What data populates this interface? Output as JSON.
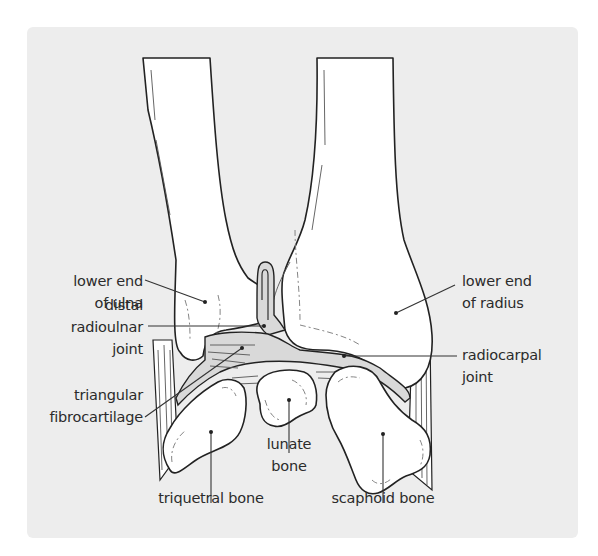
{
  "diagram": {
    "background_color": "#ededed",
    "line_color": "#222222",
    "bone_fill": "#ffffff",
    "cartilage_fill": "#d9d9d9",
    "labels": {
      "ulna_end": {
        "line1": "lower end",
        "line2": "of ulna"
      },
      "radius_end": {
        "line1": "lower end",
        "line2": "of radius"
      },
      "distal_radioulnar": {
        "line1": "distal",
        "line2": "radioulnar",
        "line3": "joint"
      },
      "radiocarpal": {
        "line1": "radiocarpal",
        "line2": "joint"
      },
      "fibrocartilage": {
        "line1": "triangular",
        "line2": "fibrocartilage"
      },
      "lunate": {
        "line1": "lunate",
        "line2": "bone"
      },
      "triquetral": {
        "line1": "triquetral bone"
      },
      "scaphoid": {
        "line1": "scaphoid bone"
      }
    },
    "structures": [
      "ulna",
      "radius",
      "triangular fibrocartilage",
      "triquetral bone",
      "lunate bone",
      "scaphoid bone",
      "distal radioulnar joint",
      "radiocarpal joint"
    ]
  }
}
